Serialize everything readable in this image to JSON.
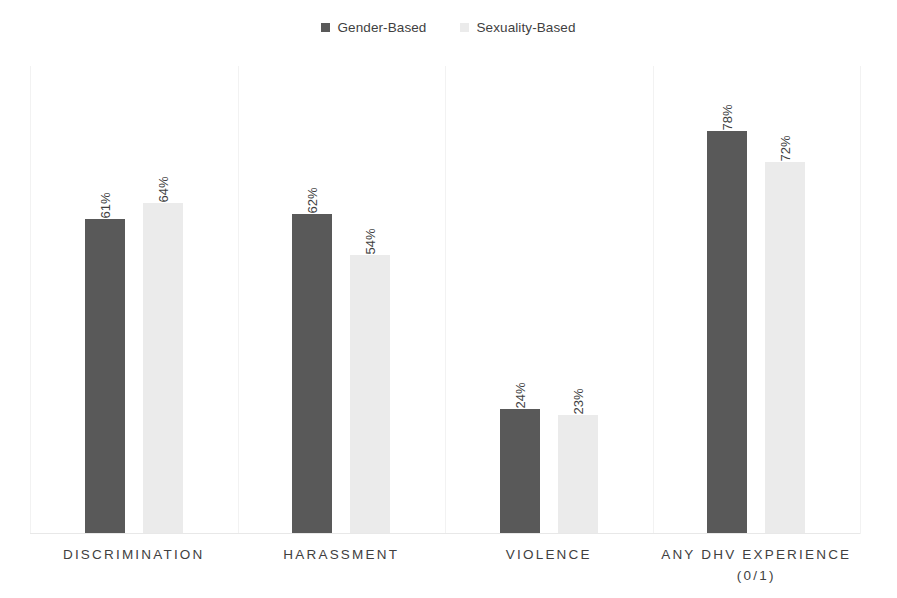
{
  "legend": {
    "entries": [
      {
        "label": "Gender-Based",
        "color": "#595959",
        "swatch_name": "legend-swatch-gender-based"
      },
      {
        "label": "Sexuality-Based",
        "color": "#ebebeb",
        "swatch_name": "legend-swatch-sexuality-based"
      }
    ]
  },
  "chart_data": {
    "type": "bar",
    "title": "",
    "xlabel": "",
    "ylabel": "",
    "ylim": [
      0,
      90
    ],
    "grid": "vertical-category-separators",
    "legend_position": "top-center",
    "value_label_format": "percent",
    "value_label_rotation": -90,
    "categories": [
      "DISCRIMINATION",
      "HARASSMENT",
      "VIOLENCE",
      "ANY DHV EXPERIENCE\n(0/1)"
    ],
    "series": [
      {
        "name": "Gender-Based",
        "color": "#595959",
        "values": [
          61,
          62,
          24,
          78
        ],
        "labels": [
          "61%",
          "62%",
          "24%",
          "78%"
        ]
      },
      {
        "name": "Sexuality-Based",
        "color": "#ebebeb",
        "values": [
          64,
          54,
          23,
          72
        ],
        "labels": [
          "64%",
          "54%",
          "23%",
          "72%"
        ]
      }
    ]
  }
}
